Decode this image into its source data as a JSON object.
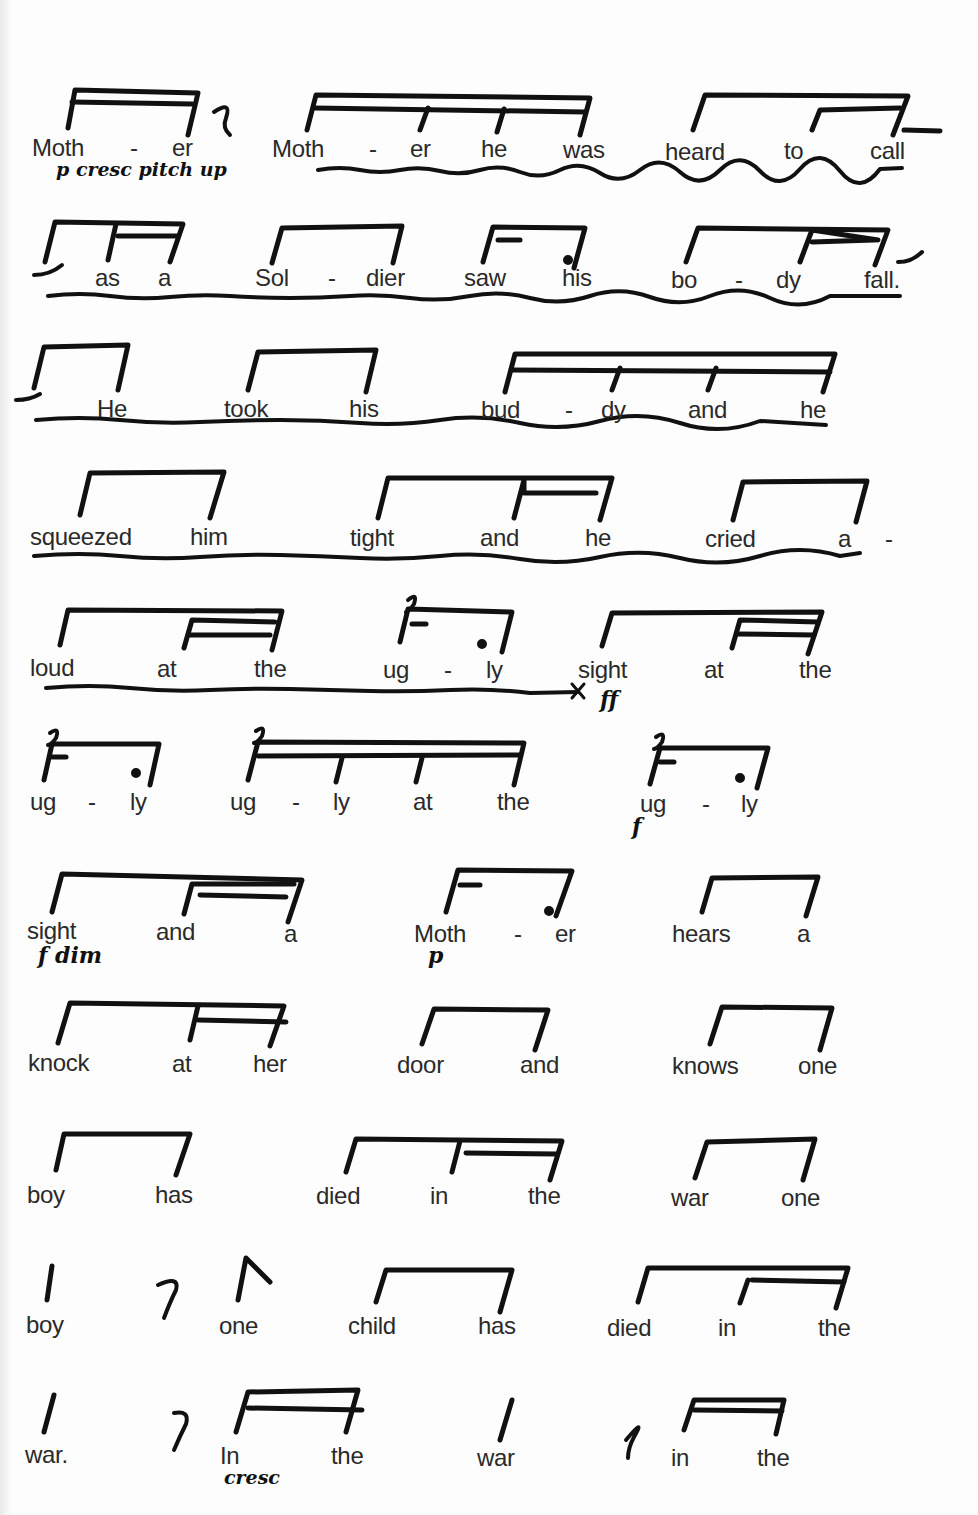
{
  "document": {
    "type": "rhythmic-speech-score",
    "lines": [
      {
        "words": [
          "Moth",
          "-",
          "er",
          "Moth",
          "-",
          "er",
          "he",
          "was",
          "heard",
          "to",
          "call"
        ],
        "annotations": [
          "p cresc pitch up"
        ]
      },
      {
        "words": [
          "as",
          "a",
          "Sol",
          "-",
          "dier",
          "saw",
          "his",
          "bo",
          "-",
          "dy",
          "fall."
        ],
        "annotations": []
      },
      {
        "words": [
          "He",
          "took",
          "his",
          "bud",
          "-",
          "dy",
          "and",
          "he"
        ],
        "annotations": []
      },
      {
        "words": [
          "squeezed",
          "him",
          "tight",
          "and",
          "he",
          "cried",
          "a",
          "-"
        ],
        "annotations": []
      },
      {
        "words": [
          "loud",
          "at",
          "the",
          "ug",
          "-",
          "ly",
          "sight",
          "at",
          "the"
        ],
        "annotations": [
          "ff"
        ]
      },
      {
        "words": [
          "ug",
          "-",
          "ly",
          "ug",
          "-",
          "ly",
          "at",
          "the",
          "ug",
          "-",
          "ly"
        ],
        "annotations": [
          "f"
        ]
      },
      {
        "words": [
          "sight",
          "and",
          "a",
          "Moth",
          "-",
          "er",
          "hears",
          "a"
        ],
        "annotations": [
          "f dim",
          "p"
        ]
      },
      {
        "words": [
          "knock",
          "at",
          "her",
          "door",
          "and",
          "knows",
          "one"
        ],
        "annotations": []
      },
      {
        "words": [
          "boy",
          "has",
          "died",
          "in",
          "the",
          "war",
          "one"
        ],
        "annotations": []
      },
      {
        "words": [
          "boy",
          "one",
          "child",
          "has",
          "died",
          "in",
          "the"
        ],
        "annotations": []
      },
      {
        "words": [
          "war.",
          "In",
          "the",
          "war",
          "in",
          "the"
        ],
        "annotations": [
          "cresc"
        ]
      }
    ]
  }
}
